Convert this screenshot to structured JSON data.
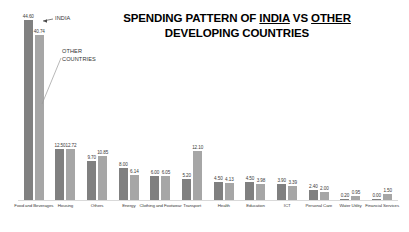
{
  "chart": {
    "title_line1_pre": "SPENDING PATTERN OF ",
    "title_word1": "INDIA",
    "title_mid": " VS ",
    "title_word2": "OTHER",
    "title_line2": "DEVELOPING COUNTRIES",
    "annotation_india": "INDIA",
    "annotation_other_line1": "OTHER",
    "annotation_other_line2": "COUNTRIES",
    "color_india": "#808080",
    "color_other": "#a6a6a6"
  },
  "chart_data": {
    "type": "bar",
    "title": "SPENDING PATTERN OF INDIA VS OTHER DEVELOPING COUNTRIES",
    "xlabel": "",
    "ylabel": "",
    "ylim": [
      0,
      46
    ],
    "grid": false,
    "legend": "annotations",
    "categories": [
      "Food and Beverages",
      "Housing",
      "Others",
      "Energy",
      "Clothing and Footwear",
      "Transport",
      "Health",
      "Education",
      "ICT",
      "Personal Care",
      "Water Utility",
      "Financial Services"
    ],
    "series": [
      {
        "name": "INDIA",
        "values": [
          44.6,
          12.5,
          9.7,
          8.0,
          6.0,
          5.2,
          4.5,
          4.5,
          3.9,
          2.4,
          0.2,
          0.0
        ]
      },
      {
        "name": "OTHER COUNTRIES",
        "values": [
          40.74,
          12.72,
          10.85,
          6.14,
          6.05,
          12.1,
          4.13,
          3.98,
          3.39,
          2.0,
          0.95,
          1.5
        ]
      }
    ],
    "value_labels": [
      [
        "44.60",
        "40.74"
      ],
      [
        "12.50",
        "12.72"
      ],
      [
        "9.70",
        "10.85"
      ],
      [
        "8.00",
        "6.14"
      ],
      [
        "6.00",
        "6.05"
      ],
      [
        "5.20",
        "12.10"
      ],
      [
        "4.50",
        "4.13"
      ],
      [
        "4.50",
        "3.98"
      ],
      [
        "3.90",
        "3.39"
      ],
      [
        "2.40",
        "2.00"
      ],
      [
        "0.20",
        "0.95"
      ],
      [
        "0.00",
        "1.50"
      ]
    ]
  }
}
